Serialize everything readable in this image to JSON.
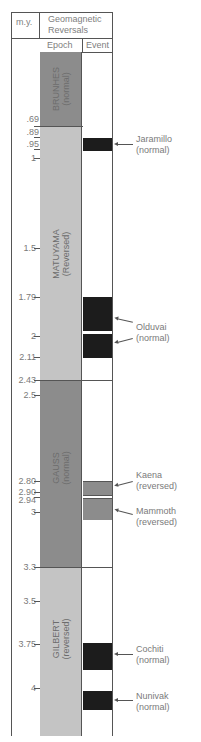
{
  "header": {
    "my_label": "m.y.",
    "title_line1": "Geomagnetic",
    "title_line2": "Reversals",
    "col_epoch": "Epoch",
    "col_event": "Event"
  },
  "colors": {
    "normal_epoch": "#8c8c8c",
    "reversed_epoch": "#c4c4c4",
    "normal_event": "#1c1c1c",
    "reversed_event": "#8c8c8c",
    "border": "#555555"
  },
  "epochs": [
    {
      "name": "BRUNHES",
      "polarity": "(normal)",
      "start_my": 0,
      "end_my": 0.69
    },
    {
      "name": "MATUYAMA",
      "polarity": "(Reversed)",
      "start_my": 0.69,
      "end_my": 2.43
    },
    {
      "name": "GAUSS",
      "polarity": "(normal)",
      "start_my": 2.43,
      "end_my": 3.3
    },
    {
      "name": "GILBERT",
      "polarity": "(reversed)",
      "start_my": 3.3,
      "end_my": 4.2
    }
  ],
  "events": [
    {
      "name": "Jaramillo",
      "polarity": "(normal)",
      "start_my": 0.89,
      "end_my": 0.95
    },
    {
      "name": "Olduvai",
      "polarity": "(normal)",
      "start_my": 1.79,
      "end_my": 2.11
    },
    {
      "name": "Kaena",
      "polarity": "(reversed)",
      "start_my": 2.8,
      "end_my": 2.9
    },
    {
      "name": "Mammoth",
      "polarity": "(reversed)",
      "start_my": 2.94,
      "end_my": 3.06
    },
    {
      "name": "Cochiti",
      "polarity": "(normal)",
      "start_my": 3.75,
      "end_my": 3.9
    },
    {
      "name": "Nunivak",
      "polarity": "(normal)",
      "start_my": 4.05,
      "end_my": 4.15
    }
  ],
  "ticks": [
    ".69",
    ".89",
    ".95",
    "1",
    "1.5",
    "1.79",
    "2",
    "2.11",
    "2.43",
    "2.5",
    "2.80",
    "2.90",
    "2.94",
    "3",
    "3.3",
    "3.5",
    "3.75",
    "4"
  ]
}
